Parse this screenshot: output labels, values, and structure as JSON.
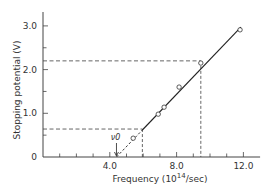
{
  "chart_data": {
    "type": "scatter",
    "title": "",
    "xlabel": "Frequency (10^14/sec)",
    "xlabel_parts": {
      "prefix": "Frequency (10",
      "sup": "14",
      "suffix": "/sec)"
    },
    "ylabel": "Stopping potential (V)",
    "xlim": [
      0,
      13.0
    ],
    "ylim": [
      0,
      3.4
    ],
    "x_ticks_major": [
      4.0,
      8.0,
      12.0
    ],
    "x_tick_labels": [
      "4.0",
      "8.0",
      "12.0"
    ],
    "x_ticks_minor_step": 1.0,
    "y_ticks": [
      0,
      1.0,
      2.0,
      3.0
    ],
    "y_tick_labels": [
      "0",
      "1.0",
      "2.0",
      "3.0"
    ],
    "y_ticks_minor_step": 0.5,
    "grid": false,
    "legend": null,
    "series": [
      {
        "name": "measured",
        "marker": "open-circle",
        "points": [
          {
            "x": 5.4,
            "y": 0.43
          },
          {
            "x": 6.9,
            "y": 0.98
          },
          {
            "x": 7.25,
            "y": 1.14
          },
          {
            "x": 8.15,
            "y": 1.6
          },
          {
            "x": 9.45,
            "y": 2.15
          },
          {
            "x": 11.8,
            "y": 2.91
          }
        ]
      }
    ],
    "fit_line": {
      "x_start": 4.4,
      "y_start": 0.0,
      "x_dashed_end": 5.95,
      "x_end": 11.85,
      "y_end": 2.97
    },
    "guides": [
      {
        "x": 5.95,
        "y": 0.64
      },
      {
        "x": 9.45,
        "y": 2.2
      }
    ],
    "annotations": [
      {
        "text": "ν0",
        "x": 4.4,
        "y": 0.0,
        "arrow": true
      }
    ]
  }
}
